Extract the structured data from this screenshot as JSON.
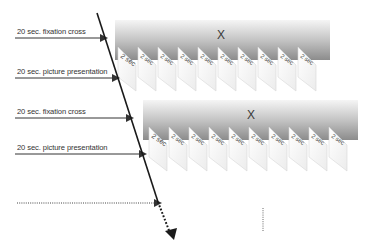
{
  "labels": [
    {
      "text": "20 sec. fixation cross",
      "y": 29
    },
    {
      "text": "20 sec. picture presentation",
      "y": 70
    },
    {
      "text": "20 sec. fixation cross",
      "y": 111
    },
    {
      "text": "20 sec. picture presentation",
      "y": 152
    }
  ],
  "fixation_symbol": "X",
  "card_text_first": "2 sec",
  "card_text_rest": "2 sec",
  "blocks": [
    {
      "name": "block-1",
      "band_x": 115,
      "band_y": 20,
      "band_w": 215,
      "band_h": 40,
      "cards": 10,
      "card_start_x": 118,
      "card_step": 20,
      "card_top": 47,
      "x_label_x": 217,
      "x_label_y": 39
    },
    {
      "name": "block-2",
      "band_x": 143,
      "band_y": 100,
      "band_w": 215,
      "band_h": 40,
      "cards": 10,
      "card_start_x": 149,
      "card_step": 20,
      "card_top": 127,
      "x_label_x": 247,
      "x_label_y": 119
    }
  ],
  "colors": {
    "band_top": "#f2f2f2",
    "band_bottom": "#8f8f8f",
    "card_fill": "#ffffff",
    "card_edge": "#cfcfcf",
    "arrow": "#1a1a1a",
    "text": "#333333"
  }
}
